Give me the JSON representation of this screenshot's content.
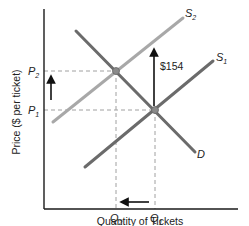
{
  "chart_data": {
    "type": "line",
    "title": "",
    "xlabel": "Quantity of Tickets",
    "ylabel": "Price ($ per ticket)",
    "grid": false,
    "legend": "none",
    "series": [
      {
        "name": "D",
        "color": "#6b6b6b",
        "points": [
          [
            0.17,
            0.89
          ],
          [
            0.78,
            0.29
          ]
        ]
      },
      {
        "name": "S1",
        "color": "#6b6b6b",
        "points": [
          [
            0.21,
            0.21
          ],
          [
            0.87,
            0.74
          ]
        ]
      },
      {
        "name": "S2",
        "color": "#a8a8a8",
        "points": [
          [
            0.05,
            0.44
          ],
          [
            0.72,
            0.96
          ]
        ]
      }
    ],
    "equilibria": [
      {
        "name": "E2",
        "x_label": "Q2",
        "y_label": "P2",
        "x": 0.37,
        "y": 0.69
      },
      {
        "name": "E1",
        "x_label": "Q1",
        "y_label": "P1",
        "x": 0.57,
        "y": 0.5
      }
    ],
    "annotations": [
      {
        "text": "$154",
        "type": "arrow-up",
        "description": "vertical shift of supply from S1 to S2"
      },
      {
        "text": "",
        "type": "arrow-up",
        "description": "price rises from P1 to P2"
      },
      {
        "text": "",
        "type": "arrow-left",
        "description": "quantity falls from Q1 to Q2"
      }
    ],
    "x_ticks": [
      "Q2",
      "Q1"
    ],
    "y_ticks": [
      "P1",
      "P2"
    ]
  },
  "labels": {
    "ylabel": "Price ($ per ticket)",
    "xlabel": "Quantity of Tickets",
    "p2": "P",
    "p2_sub": "2",
    "p1": "P",
    "p1_sub": "1",
    "q2": "Q",
    "q2_sub": "2",
    "q1": "Q",
    "q1_sub": "1",
    "s2": "S",
    "s2_sub": "2",
    "s1": "S",
    "s1_sub": "1",
    "d": "D",
    "shift": "$154"
  },
  "colors": {
    "axis": "#1a1a1a",
    "demand": "#6b6b6b",
    "supply1": "#6b6b6b",
    "supply2": "#a8a8a8",
    "dashed": "#a0a0a0",
    "arrow": "#111111",
    "point": "#8a8a8a"
  }
}
